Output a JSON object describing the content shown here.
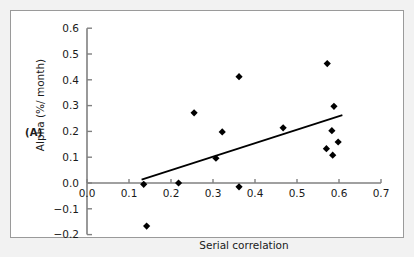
{
  "figure": {
    "panel_label": "(A)",
    "background_color": "#f2f2f2",
    "plot_background": "#ffffff",
    "border_color": "#9a9a9a"
  },
  "chart_data": {
    "type": "scatter",
    "title": "",
    "xlabel": "Serial correlation",
    "ylabel": "Alpha (%/ month)",
    "xlim": [
      0.0,
      0.7
    ],
    "ylim": [
      -0.2,
      0.6
    ],
    "xticks": [
      "0.0",
      "0.1",
      "0.2",
      "0.3",
      "0.4",
      "0.5",
      "0.6",
      "0.7"
    ],
    "xtick_values": [
      0.0,
      0.1,
      0.2,
      0.3,
      0.4,
      0.5,
      0.6,
      0.7
    ],
    "yticks": [
      "0.6",
      "0.5",
      "0.4",
      "0.3",
      "0.2",
      "0.1",
      "0.0",
      "-0.1",
      "-0.2"
    ],
    "ytick_values": [
      0.6,
      0.5,
      0.4,
      0.3,
      0.2,
      0.1,
      0.0,
      -0.1,
      -0.2
    ],
    "grid": false,
    "legend": null,
    "marker": "diamond",
    "marker_color": "#000000",
    "points": [
      {
        "x": 0.135,
        "y": -0.005
      },
      {
        "x": 0.142,
        "y": -0.167
      },
      {
        "x": 0.218,
        "y": 0.0
      },
      {
        "x": 0.255,
        "y": 0.272
      },
      {
        "x": 0.307,
        "y": 0.096
      },
      {
        "x": 0.322,
        "y": 0.198
      },
      {
        "x": 0.362,
        "y": 0.412
      },
      {
        "x": 0.362,
        "y": -0.015
      },
      {
        "x": 0.467,
        "y": 0.214
      },
      {
        "x": 0.572,
        "y": 0.463
      },
      {
        "x": 0.57,
        "y": 0.133
      },
      {
        "x": 0.583,
        "y": 0.203
      },
      {
        "x": 0.588,
        "y": 0.297
      },
      {
        "x": 0.585,
        "y": 0.108
      },
      {
        "x": 0.598,
        "y": 0.159
      }
    ],
    "trendline": {
      "x_start": 0.13,
      "y_start": 0.013,
      "x_end": 0.608,
      "y_end": 0.263,
      "color": "#000000"
    }
  }
}
